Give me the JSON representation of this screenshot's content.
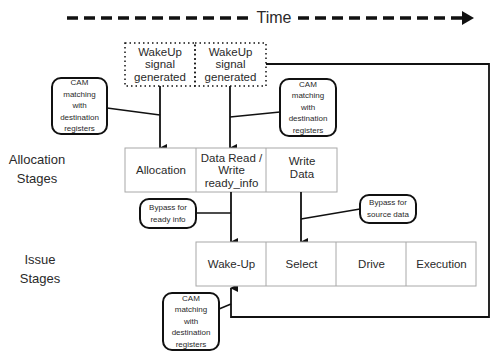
{
  "timeline": {
    "label": "Time"
  },
  "row_labels": {
    "allocation": "Allocation\nStages",
    "issue": "Issue\nStages"
  },
  "wakeup_boxes": [
    {
      "text": "WakeUp\nsignal\ngenerated"
    },
    {
      "text": "WakeUp\nsignal\ngenerated"
    }
  ],
  "allocation_stages": [
    {
      "text": "Allocation"
    },
    {
      "text": "Data Read /\nWrite\nready_info"
    },
    {
      "text": "Write\nData"
    }
  ],
  "issue_stages": [
    {
      "text": "Wake-Up"
    },
    {
      "text": "Select"
    },
    {
      "text": "Drive"
    },
    {
      "text": "Execution"
    }
  ],
  "callouts": {
    "cam_left": "CAM\nmatching\nwith\ndestination\nregisters",
    "cam_right": "CAM\nmatching\nwith\ndestination\nregisters",
    "cam_bottom": "CAM\nmatching\nwith\ndestination\nregisters",
    "bypass_ready": "Bypass for\nready info",
    "bypass_source": "Bypass for\nsource data"
  },
  "colors": {
    "line": "#111111",
    "cell_border": "#a8a8a8",
    "text": "#2a2a2a"
  }
}
